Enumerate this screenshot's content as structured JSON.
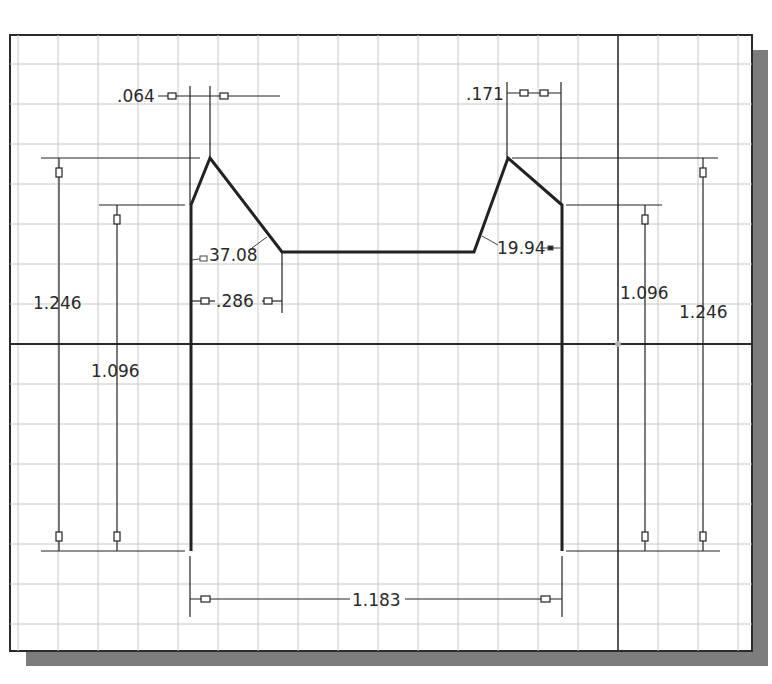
{
  "sketch": {
    "frame": {
      "x": 10,
      "y": 35,
      "width": 742,
      "height": 616
    },
    "shadow": {
      "offset_x": 16,
      "offset_y": 15,
      "color": "#7a7a7a"
    },
    "grid": {
      "spacing": 40,
      "origin_x": 618,
      "origin_y": 344,
      "line_color": "#c8c8c8",
      "axis_color": "#2a2a2a"
    },
    "origin_point": {
      "x": 618,
      "y": 344,
      "color": "#b0b0b0"
    },
    "profile": {
      "color": "#222222",
      "points": [
        [
          191,
          551
        ],
        [
          191,
          205
        ],
        [
          210,
          158
        ],
        [
          282,
          252
        ],
        [
          474,
          252
        ],
        [
          508,
          158
        ],
        [
          562,
          205
        ],
        [
          562,
          551
        ]
      ]
    }
  },
  "dimensions": {
    "top_left_horizontal": {
      "label": ".064",
      "value": 0.064
    },
    "top_right_horizontal": {
      "label": ".171",
      "value": 0.171
    },
    "left_angle": {
      "label": "37.08",
      "value": 37.08,
      "unit": "deg"
    },
    "right_angle": {
      "label": "19.94",
      "value": 19.94,
      "unit": "deg"
    },
    "inner_horizontal": {
      "label": ".286",
      "value": 0.286
    },
    "left_outer_height": {
      "label": "1.246",
      "value": 1.246
    },
    "left_inner_height": {
      "label": "1.096",
      "value": 1.096
    },
    "right_inner_height": {
      "label": "1.096",
      "value": 1.096
    },
    "right_outer_height": {
      "label": "1.246",
      "value": 1.246
    },
    "bottom_width": {
      "label": "1.183",
      "value": 1.183
    }
  }
}
